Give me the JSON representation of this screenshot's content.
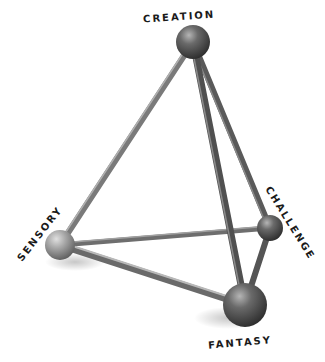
{
  "diagram": {
    "type": "tetrahedron",
    "nodes": [
      {
        "id": "creation",
        "label": "CREATION",
        "cx": 193,
        "cy": 42,
        "r": 17
      },
      {
        "id": "sensory",
        "label": "SENSORY",
        "cx": 60,
        "cy": 245,
        "r": 15
      },
      {
        "id": "challenge",
        "label": "CHALLENGE",
        "cx": 270,
        "cy": 228,
        "r": 13
      },
      {
        "id": "fantasy",
        "label": "FANTASY",
        "cx": 245,
        "cy": 305,
        "r": 22
      }
    ],
    "edges": [
      [
        "creation",
        "sensory"
      ],
      [
        "creation",
        "challenge"
      ],
      [
        "creation",
        "fantasy"
      ],
      [
        "sensory",
        "challenge"
      ],
      [
        "sensory",
        "fantasy"
      ],
      [
        "challenge",
        "fantasy"
      ]
    ]
  },
  "labels": {
    "creation": "CREATION",
    "sensory": "SENSORY",
    "challenge": "CHALLENGE",
    "fantasy": "FANTASY"
  }
}
